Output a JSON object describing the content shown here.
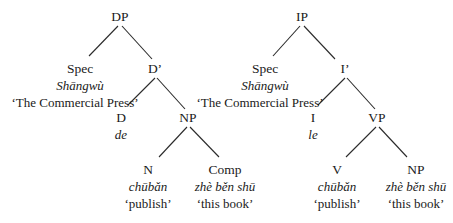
{
  "trees": [
    {
      "id": "dp-tree",
      "nodes": [
        {
          "key": "DP",
          "label": "DP",
          "x": 120,
          "y": 17
        },
        {
          "key": "Spec",
          "label": "Spec",
          "x": 80,
          "y": 69,
          "form": "Shāngwù",
          "gloss": "‘The Commercial Press’"
        },
        {
          "key": "Dbar",
          "label": "D’",
          "x": 155,
          "y": 69
        },
        {
          "key": "D",
          "label": "D",
          "x": 121,
          "y": 118,
          "form": "de"
        },
        {
          "key": "NP",
          "label": "NP",
          "x": 188,
          "y": 118
        },
        {
          "key": "N",
          "label": "N",
          "x": 148,
          "y": 170,
          "form": "chūbǎn",
          "gloss": "‘publish’"
        },
        {
          "key": "Comp",
          "label": "Comp",
          "x": 225,
          "y": 170,
          "form": "zhè běn shū",
          "gloss": "‘this book’"
        }
      ],
      "edges": [
        [
          118,
          26,
          89,
          56
        ],
        [
          122,
          26,
          152,
          59
        ],
        [
          155,
          78,
          128,
          105
        ],
        [
          157,
          78,
          185,
          109
        ],
        [
          187,
          127,
          159,
          157
        ],
        [
          190,
          127,
          219,
          157
        ]
      ]
    },
    {
      "id": "ip-tree",
      "nodes": [
        {
          "key": "IP",
          "label": "IP",
          "x": 302,
          "y": 17
        },
        {
          "key": "Spec",
          "label": "Spec",
          "x": 265,
          "y": 69,
          "form": "Shāngwù",
          "gloss": "‘The Commercial Press’"
        },
        {
          "key": "Ibar",
          "label": "I’",
          "x": 345,
          "y": 69
        },
        {
          "key": "I",
          "label": "I",
          "x": 313,
          "y": 118,
          "form": "le"
        },
        {
          "key": "VP",
          "label": "VP",
          "x": 377,
          "y": 118
        },
        {
          "key": "V",
          "label": "V",
          "x": 337,
          "y": 170,
          "form": "chūbǎn",
          "gloss": "‘publish’"
        },
        {
          "key": "NP",
          "label": "NP",
          "x": 416,
          "y": 170,
          "form": "zhè běn shū",
          "gloss": "‘this book’"
        }
      ],
      "edges": [
        [
          300,
          26,
          273,
          56
        ],
        [
          304,
          26,
          335,
          59
        ],
        [
          345,
          78,
          318,
          105
        ],
        [
          347,
          78,
          375,
          109
        ],
        [
          376,
          127,
          346,
          157
        ],
        [
          379,
          127,
          407,
          157
        ]
      ]
    }
  ],
  "style": {
    "line_color": "#2a2a2a",
    "text_color": "#1a1a1a"
  }
}
